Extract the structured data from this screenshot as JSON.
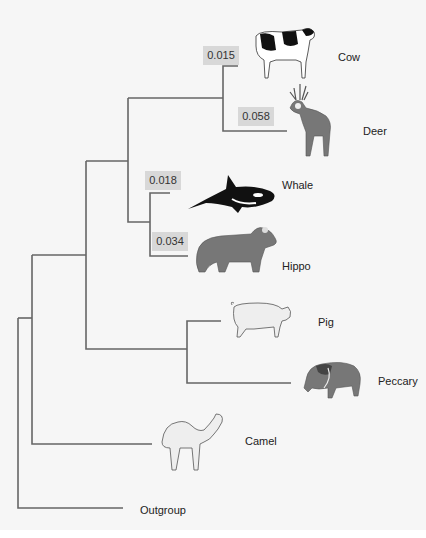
{
  "diagram": {
    "type": "phylogenetic-tree",
    "colors": {
      "background": "#f6f6f6",
      "branch": "#666666",
      "distance_box": "#d8d8d8",
      "text": "#222222"
    },
    "taxa": [
      {
        "name": "Cow",
        "distance": "0.015"
      },
      {
        "name": "Deer",
        "distance": "0.058"
      },
      {
        "name": "Whale",
        "distance": "0.018"
      },
      {
        "name": "Hippo",
        "distance": "0.034"
      },
      {
        "name": "Pig"
      },
      {
        "name": "Peccary"
      },
      {
        "name": "Camel"
      },
      {
        "name": "Outgroup"
      }
    ],
    "topology": "(Outgroup,(Camel,(((Cow,Deer),(Whale,Hippo)),(Pig,Peccary))))",
    "icons": [
      "cow-icon",
      "deer-icon",
      "whale-icon",
      "hippo-icon",
      "pig-icon",
      "peccary-icon",
      "camel-icon"
    ]
  }
}
